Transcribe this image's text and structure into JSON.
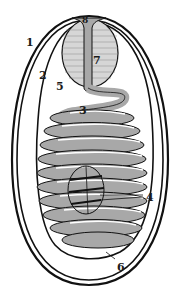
{
  "figure": {
    "type": "labeled biological diagram",
    "colors": {
      "outline": "#111111",
      "coil_fill": "#a8a8a8",
      "sac_fill": "#d6d6d6",
      "background": "#ffffff"
    },
    "labels": [
      {
        "id": "1",
        "text": "1",
        "x": 26,
        "y": 37
      },
      {
        "id": "2",
        "text": "2",
        "x": 39,
        "y": 70
      },
      {
        "id": "3",
        "text": "3",
        "x": 79,
        "y": 105
      },
      {
        "id": "4",
        "text": "4",
        "x": 146,
        "y": 192
      },
      {
        "id": "5",
        "text": "5",
        "x": 56,
        "y": 81
      },
      {
        "id": "6",
        "text": "6",
        "x": 117,
        "y": 262
      },
      {
        "id": "7",
        "text": "7",
        "x": 93,
        "y": 55
      },
      {
        "id": "8",
        "text": "8",
        "x": 82,
        "y": 16
      }
    ]
  }
}
